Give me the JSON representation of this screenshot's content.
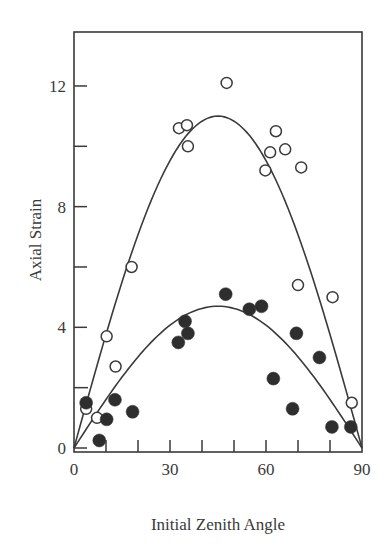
{
  "chart_data": {
    "type": "scatter",
    "title": "",
    "xlabel": "Initial Zenith Angle",
    "ylabel": "Axial Strain",
    "xlim": [
      0,
      90
    ],
    "ylim": [
      0,
      14
    ],
    "x_ticks": [
      0,
      10,
      20,
      30,
      40,
      50,
      60,
      70,
      80,
      90
    ],
    "x_tick_labels": [
      "0",
      "30",
      "60",
      "90"
    ],
    "x_labeled_ticks": [
      0,
      30,
      60,
      90
    ],
    "y_ticks": [
      0,
      2,
      4,
      6,
      8,
      10,
      12
    ],
    "y_tick_labels": [
      "0",
      "4",
      "8",
      "12"
    ],
    "y_labeled_ticks": [
      0,
      4,
      8,
      12
    ],
    "grid": false,
    "legend": null,
    "series": [
      {
        "name": "Open circles",
        "marker": "open-circle",
        "x": [
          3.8,
          7.2,
          10.2,
          13.0,
          18.0,
          32.8,
          35.3,
          35.6,
          47.7,
          59.8,
          61.3,
          63.1,
          66.0,
          71.0,
          70.0,
          80.8,
          86.8
        ],
        "y": [
          1.3,
          1.0,
          3.7,
          2.7,
          6.0,
          10.6,
          10.7,
          10.0,
          12.1,
          9.2,
          9.8,
          10.5,
          9.9,
          9.3,
          5.4,
          5.0,
          1.5
        ]
      },
      {
        "name": "Filled circles",
        "marker": "filled-circle",
        "x": [
          3.8,
          7.9,
          10.2,
          12.8,
          18.3,
          32.6,
          34.7,
          35.6,
          47.4,
          54.8,
          58.6,
          62.3,
          68.3,
          69.5,
          76.7,
          80.6,
          86.5
        ],
        "y": [
          1.5,
          0.25,
          0.95,
          1.6,
          1.2,
          3.5,
          4.2,
          3.8,
          5.1,
          4.6,
          4.7,
          2.3,
          1.3,
          3.8,
          3.0,
          0.7,
          0.7
        ]
      }
    ],
    "fit_curves": [
      {
        "name": "Upper fit (open circles)",
        "shape": "sin(2θ)",
        "peak_x": 44,
        "peak_y": 11.0
      },
      {
        "name": "Lower fit (filled circles)",
        "shape": "sin(2θ)",
        "peak_x": 44,
        "peak_y": 4.7
      }
    ]
  }
}
